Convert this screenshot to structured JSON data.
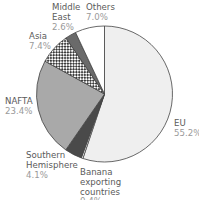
{
  "chart_data": {
    "type": "pie",
    "title": "",
    "start": "top",
    "direction": "clockwise",
    "slices": [
      {
        "label": [
          "EU"
        ],
        "value": 55.2,
        "value_label": "55.2%",
        "fill": "#efefef",
        "pattern": "none"
      },
      {
        "label": [
          "Banana",
          "exporting",
          "countries"
        ],
        "value": 0.4,
        "value_label": "0.4%",
        "fill": "#ffffff",
        "pattern": "none"
      },
      {
        "label": [
          "Southern",
          "Hemisphere"
        ],
        "value": 4.1,
        "value_label": "4.1%",
        "fill": "#4a4a4a",
        "pattern": "none"
      },
      {
        "label": [
          "NAFTA"
        ],
        "value": 23.4,
        "value_label": "23.4%",
        "fill": "#a9a9a9",
        "pattern": "none"
      },
      {
        "label": [
          "Asia"
        ],
        "value": 7.4,
        "value_label": "7.4%",
        "fill": "#ffffff",
        "pattern": "checker"
      },
      {
        "label": [
          "Middle",
          "East"
        ],
        "value": 2.6,
        "value_label": "2.6%",
        "fill": "#6a6a6a",
        "pattern": "none"
      },
      {
        "label": [
          "Others"
        ],
        "value": 7.0,
        "value_label": "7.0%",
        "fill": "#ffffff",
        "pattern": "none"
      }
    ],
    "legend": "none",
    "labels": "outside"
  }
}
